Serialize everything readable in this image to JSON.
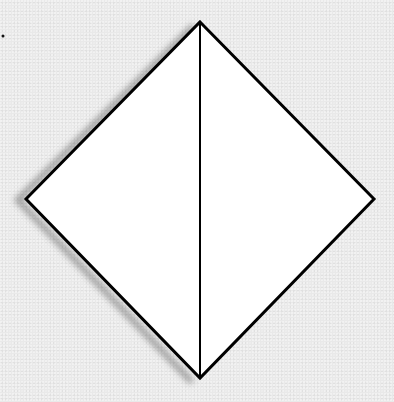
{
  "diagram": {
    "type": "folded-square-diamond",
    "background_color": "#e9e9e9",
    "fill_color": "#ffffff",
    "stroke_color": "#000000",
    "vertices": {
      "top": [
        200,
        22
      ],
      "left": [
        26,
        199
      ],
      "right": [
        374,
        199
      ],
      "bottom": [
        200,
        378
      ]
    },
    "crease": {
      "from": "top",
      "to": "bottom"
    },
    "marker_dot": [
      3,
      36
    ]
  }
}
